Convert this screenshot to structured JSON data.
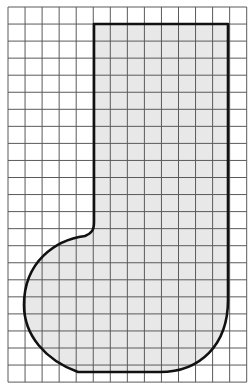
{
  "figure": {
    "background": "#ffffff",
    "grid": {
      "x0": 8,
      "y0": 7,
      "cols": 14,
      "rows": 22,
      "cell": 17.05,
      "line_color": "#5a5a5a",
      "line_width": 1
    },
    "shape": {
      "fill": "#e8e8e8",
      "stroke": "#111111",
      "stroke_width": 2.6,
      "path": "M 94 24 L 228 24 L 228 300 C 228 345 200 372 160 372 L 78 372 C 45 360 24 335 24 305 C 24 262 55 240 85 236 C 92 233 94 230 94 222 Z"
    }
  }
}
